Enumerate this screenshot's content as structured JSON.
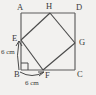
{
  "figure": {
    "type": "geometry-diagram",
    "background_color": "#f2f1ef",
    "line_color": "#4a4a4a",
    "outer_square": {
      "name": "ABCD",
      "vertices": [
        {
          "id": "A",
          "label": "A",
          "x": 21,
          "y": 13
        },
        {
          "id": "D",
          "label": "D",
          "x": 75,
          "y": 13
        },
        {
          "id": "C",
          "label": "C",
          "x": 75,
          "y": 70
        },
        {
          "id": "B",
          "label": "B",
          "x": 21,
          "y": 70
        }
      ]
    },
    "inner_square": {
      "name": "EFGH",
      "vertices": [
        {
          "id": "E",
          "label": "E",
          "x": 21,
          "y": 40,
          "on_edge": "AB"
        },
        {
          "id": "F",
          "label": "F",
          "x": 43,
          "y": 70,
          "on_edge": "BC"
        },
        {
          "id": "G",
          "label": "G",
          "x": 75,
          "y": 43,
          "on_edge": "DC"
        },
        {
          "id": "H",
          "label": "H",
          "x": 50,
          "y": 13,
          "on_edge": "AD"
        }
      ]
    },
    "dimensions": [
      {
        "id": "be",
        "label": "6 cm",
        "segment": "BE",
        "orientation": "vertical"
      },
      {
        "id": "bf",
        "label": "6 cm",
        "segment": "BF",
        "orientation": "horizontal"
      }
    ],
    "right_angle": {
      "at": "B",
      "label": "right-angle-mark"
    }
  }
}
